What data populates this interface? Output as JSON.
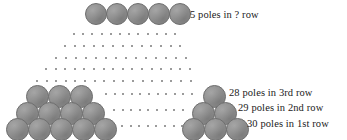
{
  "diagram": {
    "name": "pole-stack-pyramid",
    "colors": {
      "pole_fill": "#8d8d8d",
      "pole_stroke": "#6f6f6f",
      "dot": "#7a7a7a",
      "text": "#1a1a1a",
      "background": "#ffffff"
    }
  },
  "labels": [
    {
      "id": "top-row-label",
      "text": "5 poles in ? row",
      "x": 190,
      "y": 9,
      "align": "left"
    },
    {
      "id": "third-row-label",
      "text": "28 poles in 3rd row",
      "x": 229,
      "y": 87,
      "align": "left"
    },
    {
      "id": "second-row-label",
      "text": "29 poles in 2nd row",
      "x": 238,
      "y": 102,
      "align": "left"
    },
    {
      "id": "first-row-label",
      "text": "30 poles in 1st row",
      "x": 247,
      "y": 118,
      "align": "left"
    }
  ],
  "pole_rows": [
    {
      "id": "top-row",
      "label_ref": "5 poles in ? row",
      "count": 5,
      "size": 22,
      "x": 85,
      "y": 3,
      "pitch": 21
    },
    {
      "id": "third-row-left",
      "label_ref": "28 poles in 3rd row",
      "count": 3,
      "size": 23,
      "x": 26,
      "y": 85,
      "pitch": 22
    },
    {
      "id": "third-row-right",
      "label_ref": "28 poles in 3rd row",
      "count": 1,
      "size": 23,
      "x": 203,
      "y": 85,
      "pitch": 22
    },
    {
      "id": "second-row-left",
      "label_ref": "29 poles in 2nd row",
      "count": 4,
      "size": 23,
      "x": 16,
      "y": 102,
      "pitch": 22
    },
    {
      "id": "second-row-right",
      "label_ref": "29 poles in 2nd row",
      "count": 2,
      "size": 23,
      "x": 192,
      "y": 102,
      "pitch": 22
    },
    {
      "id": "first-row-left",
      "label_ref": "30 poles in 1st row",
      "count": 5,
      "size": 23,
      "x": 6,
      "y": 118,
      "pitch": 22
    },
    {
      "id": "first-row-right",
      "label_ref": "30 poles in 1st row",
      "count": 3,
      "size": 23,
      "x": 182,
      "y": 118,
      "pitch": 22
    }
  ],
  "dot_rows": [
    {
      "id": "dotrow-1",
      "count": 12,
      "x": 73,
      "y": 31,
      "pitch": 9.2
    },
    {
      "id": "dotrow-2",
      "count": 13,
      "x": 64,
      "y": 43,
      "pitch": 9.6
    },
    {
      "id": "dotrow-3",
      "count": 14,
      "x": 55,
      "y": 55,
      "pitch": 10.0
    },
    {
      "id": "dotrow-4",
      "count": 16,
      "x": 45,
      "y": 66,
      "pitch": 9.6
    },
    {
      "id": "dotrow-5",
      "count": 17,
      "x": 36,
      "y": 78,
      "pitch": 9.6
    },
    {
      "id": "dotrow-6",
      "count": 11,
      "x": 105,
      "y": 91,
      "pitch": 8.6
    },
    {
      "id": "dotrow-7",
      "count": 9,
      "x": 113,
      "y": 107,
      "pitch": 8.6
    },
    {
      "id": "dotrow-8",
      "count": 8,
      "x": 121,
      "y": 123,
      "pitch": 8.6
    }
  ]
}
